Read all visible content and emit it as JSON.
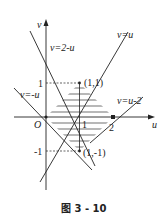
{
  "figure": {
    "caption": "图 3 - 10",
    "axes": {
      "x_label": "u",
      "y_label": "v",
      "origin_label": "O",
      "x_ticks": [
        "1",
        "2"
      ],
      "y_ticks": [
        "1",
        "-1"
      ]
    },
    "lines": [
      {
        "label": "v=u",
        "equation": "v=u"
      },
      {
        "label": "v=2-u",
        "equation": "v=2-u"
      },
      {
        "label": "v=-u",
        "equation": "v=-u"
      },
      {
        "label": "v=u-2",
        "equation": "v=u-2"
      }
    ],
    "points": [
      {
        "label": "(1,1)",
        "u": 1,
        "v": 1
      },
      {
        "label": "(1,-1)",
        "u": 1,
        "v": -1
      }
    ],
    "shaded_region": "square with vertices (0,0), (1,1), (2,0), (1,-1), horizontally hatched"
  }
}
